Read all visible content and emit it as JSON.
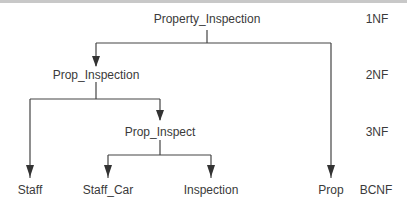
{
  "diagram": {
    "type": "normalization-decomposition-tree",
    "nodes": {
      "property_inspection": "Property_Inspection",
      "prop_inspection": "Prop_Inspection",
      "prop_inspect": "Prop_Inspect",
      "staff": "Staff",
      "staff_car": "Staff_Car",
      "inspection": "Inspection",
      "prop": "Prop"
    },
    "levels": {
      "nf1": "1NF",
      "nf2": "2NF",
      "nf3": "3NF",
      "bcnf": "BCNF"
    },
    "edges": [
      {
        "from": "Property_Inspection",
        "to": "Prop_Inspection"
      },
      {
        "from": "Property_Inspection",
        "to": "Prop"
      },
      {
        "from": "Prop_Inspection",
        "to": "Staff"
      },
      {
        "from": "Prop_Inspection",
        "to": "Prop_Inspect"
      },
      {
        "from": "Prop_Inspect",
        "to": "Staff_Car"
      },
      {
        "from": "Prop_Inspect",
        "to": "Inspection"
      }
    ]
  }
}
